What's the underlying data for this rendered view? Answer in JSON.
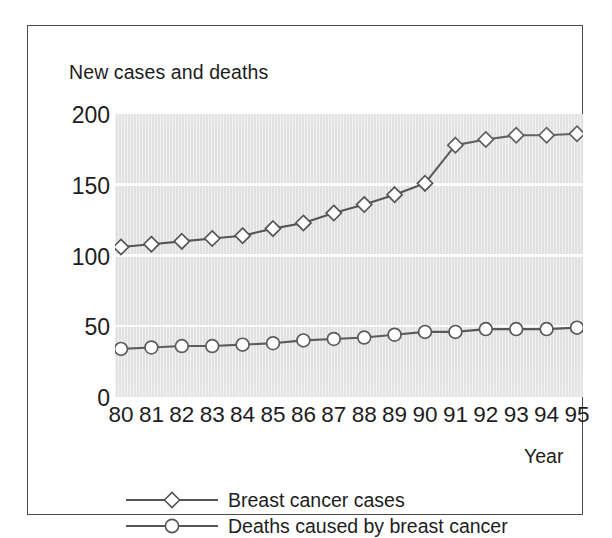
{
  "chart_data": {
    "type": "line",
    "title": "New cases and deaths",
    "xlabel": "Year",
    "ylabel": "New cases and deaths",
    "categories": [
      "80",
      "81",
      "82",
      "83",
      "84",
      "85",
      "86",
      "87",
      "88",
      "89",
      "90",
      "91",
      "92",
      "93",
      "94",
      "95"
    ],
    "x": [
      80,
      81,
      82,
      83,
      84,
      85,
      86,
      87,
      88,
      89,
      90,
      91,
      92,
      93,
      94,
      95
    ],
    "series": [
      {
        "name": "Breast cancer cases",
        "marker": "diamond",
        "color": "#555555",
        "values": [
          106,
          108,
          110,
          112,
          114,
          119,
          123,
          130,
          136,
          143,
          151,
          178,
          182,
          185,
          185,
          186
        ]
      },
      {
        "name": "Deaths caused by breast cancer",
        "marker": "circle",
        "color": "#555555",
        "values": [
          34,
          35,
          36,
          36,
          37,
          38,
          40,
          41,
          42,
          44,
          46,
          46,
          48,
          48,
          48,
          49
        ]
      }
    ],
    "yticks": [
      0,
      50,
      100,
      150,
      200
    ],
    "ylim": [
      0,
      200
    ],
    "xlim": [
      80,
      95
    ],
    "grid": true,
    "grid_color": "#ffffff",
    "plot_background": "#e0e0e0",
    "legend_position": "bottom-left"
  },
  "legend": {
    "entries": [
      {
        "label": "Breast cancer cases",
        "marker": "diamond"
      },
      {
        "label": "Deaths caused by breast cancer",
        "marker": "circle"
      }
    ]
  },
  "axis": {
    "y_tick_labels": [
      "200",
      "150",
      "100",
      "50",
      "0"
    ],
    "x_tick_labels": [
      "80",
      "81",
      "82",
      "83",
      "84",
      "85",
      "86",
      "87",
      "88",
      "89",
      "90",
      "91",
      "92",
      "93",
      "94",
      "95"
    ],
    "x_title": "Year"
  },
  "colors": {
    "line": "#555555",
    "marker_fill": "#ffffff",
    "plot_bg": "#e0e0e0",
    "grid": "#ffffff",
    "text": "#1d1d1d",
    "frame": "#4a4a4a"
  }
}
